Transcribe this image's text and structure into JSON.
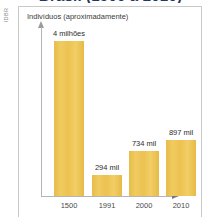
{
  "title": "Brasil (1500 a 2010)",
  "source_credit": "IDBR",
  "chart_data": {
    "type": "bar",
    "title": "Brasil (1500 a 2010)",
    "xlabel": "Ano",
    "ylabel": "Indivíduos (aproximadamente)",
    "categories": [
      "1500",
      "1991",
      "2000",
      "2010"
    ],
    "values": [
      4000000,
      294000,
      734000,
      897000
    ],
    "value_labels": [
      "4 milhões",
      "294 mil",
      "734 mil",
      "897 mil"
    ],
    "bar_heights_px": [
      155,
      21,
      45,
      56
    ],
    "ylim": [
      0,
      4400000
    ],
    "grid": false,
    "legend": null,
    "bar_color": "#EDC24C",
    "axis_color": "#B5B5B5"
  },
  "bars": [
    {
      "category": "1500",
      "label": "4 milhões",
      "left": 12,
      "height": 155
    },
    {
      "category": "1991",
      "label": "294 mil",
      "left": 50,
      "height": 21
    },
    {
      "category": "2000",
      "label": "734 mil",
      "left": 87,
      "height": 45
    },
    {
      "category": "2010",
      "label": "897 mil",
      "left": 124,
      "height": 56
    }
  ]
}
